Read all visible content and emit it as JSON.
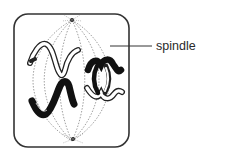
{
  "diagram": {
    "labels": [
      {
        "text": "spindle",
        "points_to": "spindle fibres"
      }
    ]
  }
}
